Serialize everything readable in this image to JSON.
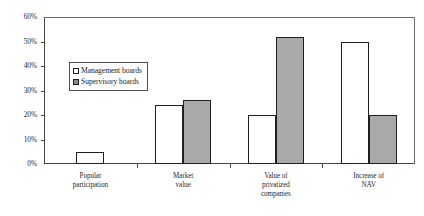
{
  "chart_data": {
    "type": "bar",
    "title": "",
    "subtitle": "",
    "xlabel": "",
    "ylabel": "",
    "categories": [
      "Popular\nparticipation",
      "Market\nvalue",
      "Value of\nprivatized\ncompanies",
      "Increase of\nNAV"
    ],
    "category_labels": [
      [
        "Popular",
        "participation"
      ],
      [
        "Market",
        "value"
      ],
      [
        "Value of",
        "privatized",
        "companies"
      ],
      [
        "Increase of",
        "NAV"
      ]
    ],
    "series": [
      {
        "name": "Management boards",
        "color": "#ffffff",
        "values": [
          5,
          24,
          20,
          50
        ]
      },
      {
        "name": "Supervisory boards",
        "color": "#a9a9a9",
        "values": [
          null,
          26,
          52,
          20
        ]
      }
    ],
    "ylim": [
      0,
      60
    ],
    "ytick_step": 10,
    "ytick_labels": [
      "0%",
      "10%",
      "20%",
      "30%",
      "40%",
      "50%",
      "60%"
    ],
    "ytick_values": [
      0,
      10,
      20,
      30,
      40,
      50,
      60
    ],
    "grid": false,
    "legend_position": "inside-upper-left",
    "value_suffix": "%"
  },
  "legend": {
    "entries": [
      {
        "label": "Management boards",
        "swatch": "hollow-square-icon"
      },
      {
        "label": "Supervisory boards",
        "swatch": "filled-square-icon"
      }
    ]
  },
  "colors": {
    "bar_outline": "#1f1f1f",
    "series_management": "#ffffff",
    "series_supervisory": "#a9a9a9",
    "axis": "#444444",
    "frame": "#6d6d6d",
    "text": "#2b2b2b",
    "background": "#ffffff"
  }
}
